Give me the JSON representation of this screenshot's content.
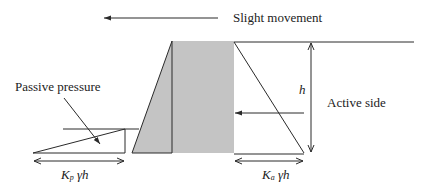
{
  "diagram": {
    "labels": {
      "movement": "Slight movement",
      "passive_pressure": "Passive pressure",
      "active_side": "Active side",
      "height": "h",
      "kp_main": "K",
      "kp_sub": "p",
      "kp_rest": " γh",
      "ka_main": "K",
      "ka_sub": "a",
      "ka_rest": " γh"
    },
    "colors": {
      "wall_fill": "#c4c4c4",
      "line": "#2a2a2a",
      "text": "#222222"
    }
  }
}
